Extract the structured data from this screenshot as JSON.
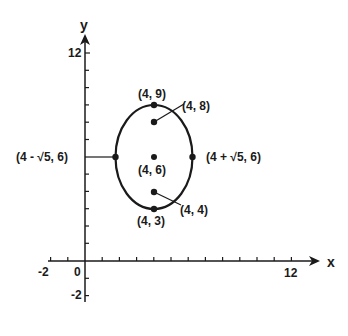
{
  "diagram": {
    "type": "ellipse-on-coordinate-plane",
    "axes": {
      "x_label": "x",
      "y_label": "y",
      "x_tick_labels": [
        "-2",
        "0",
        "12"
      ],
      "y_tick_labels": [
        "12",
        "-2"
      ],
      "x_range": [
        -3,
        14
      ],
      "y_range": [
        -3,
        13
      ]
    },
    "ellipse": {
      "center": [
        4,
        6
      ],
      "semi_major_vertical": 3,
      "semi_minor_horizontal": "√5"
    },
    "points": {
      "top_vertex": "(4, 9)",
      "focus_top": "(4, 8)",
      "center": "(4, 6)",
      "focus_bottom": "(4, 4)",
      "bottom_vertex": "(4, 3)",
      "left_covertex": "(4 - √5, 6)",
      "right_covertex": "(4 + √5, 6)"
    },
    "colors": {
      "stroke": "#1a1a1a",
      "background": "#ffffff"
    }
  }
}
